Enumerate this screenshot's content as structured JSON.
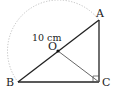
{
  "figure": {
    "type": "geometry",
    "points": {
      "A": {
        "label": "A",
        "x": 99,
        "y": 20
      },
      "B": {
        "label": "B",
        "x": 18,
        "y": 82
      },
      "C": {
        "label": "C",
        "x": 99,
        "y": 82
      },
      "O": {
        "label": "O",
        "x": 58,
        "y": 51
      }
    },
    "segments": [
      "AB",
      "BC",
      "CA",
      "OC"
    ],
    "right_angle_at": "C",
    "arc": {
      "from": "B",
      "to": "A",
      "center": "O",
      "style": "dotted"
    },
    "length_label": "10 cm",
    "colors": {
      "line": "#222222",
      "arc": "#b0b0b0"
    }
  }
}
